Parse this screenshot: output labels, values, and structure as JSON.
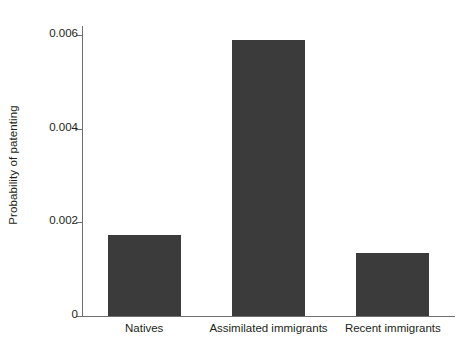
{
  "chart_data": {
    "type": "bar",
    "title": "",
    "subtitle": "",
    "xlabel": "",
    "ylabel": "Probability of patenting",
    "categories": [
      "Natives",
      "Assimilated immigrants",
      "Recent immigrants"
    ],
    "values": [
      0.00174,
      0.0059,
      0.00134
    ],
    "ylim": [
      0,
      0.0062
    ],
    "yticks": [
      0,
      0.002,
      0.004,
      0.006
    ],
    "ytick_labels": [
      "0",
      "0.002",
      "0.004",
      "0.006"
    ],
    "grid": false,
    "legend": null,
    "bar_color": "#3b3b3b",
    "axis_color": "#6f6f6f",
    "text_color": "#231f20",
    "background": "#ffffff"
  }
}
